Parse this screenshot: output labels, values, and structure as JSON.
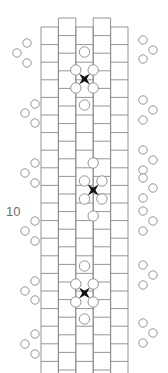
{
  "figure": {
    "type": "lattice-diagram",
    "width": 168,
    "height": 373,
    "background": "#ffffff",
    "axis_label": {
      "text": "10",
      "x": 6,
      "y": 216,
      "color": "#6e6e6e",
      "font_size": 13
    }
  },
  "style": {
    "grid_stroke": "#8a8a8a",
    "grid_stroke_width": 0.9,
    "cell_fill": "none",
    "circle_stroke": "#8a8a8a",
    "circle_stroke_width": 0.9,
    "circle_fill": "#ffffff",
    "marker_fill": "#111111",
    "cluster_circle_r": 4.2,
    "lattice_circle_r": 5.2,
    "marker_r": 5.4
  },
  "chart_data": {
    "type": "diagram",
    "title": "",
    "columns": [
      {
        "index": 0,
        "x": 41.0,
        "width": 17.4,
        "y_offset": 9.0
      },
      {
        "index": 1,
        "x": 58.4,
        "width": 17.4,
        "y_offset": 0.0
      },
      {
        "index": 2,
        "x": 75.8,
        "width": 17.4,
        "y_offset": 9.0
      },
      {
        "index": 3,
        "x": 93.2,
        "width": 17.4,
        "y_offset": 0.0
      },
      {
        "index": 4,
        "x": 110.6,
        "width": 17.4,
        "y_offset": 9.0
      }
    ],
    "row_height": 17.6,
    "grid_top": 18,
    "grid_bottom": 373,
    "markers": [
      {
        "name": "marker-1",
        "cx": 84.5,
        "cy": 79.0
      },
      {
        "name": "marker-2",
        "cx": 93.2,
        "cy": 190.0
      },
      {
        "name": "marker-3",
        "cx": 84.5,
        "cy": 293.0
      }
    ],
    "lattice_circles": [
      {
        "cx": 84.5,
        "cy": 52.0
      },
      {
        "cx": 93.2,
        "cy": 70.0
      },
      {
        "cx": 75.8,
        "cy": 70.0
      },
      {
        "cx": 93.2,
        "cy": 88.0
      },
      {
        "cx": 75.8,
        "cy": 88.0
      },
      {
        "cx": 84.5,
        "cy": 105.0
      },
      {
        "cx": 93.2,
        "cy": 163.0
      },
      {
        "cx": 101.9,
        "cy": 181.0
      },
      {
        "cx": 84.5,
        "cy": 181.0
      },
      {
        "cx": 101.9,
        "cy": 199.0
      },
      {
        "cx": 84.5,
        "cy": 199.0
      },
      {
        "cx": 93.2,
        "cy": 216.0
      },
      {
        "cx": 84.5,
        "cy": 266.0
      },
      {
        "cx": 93.2,
        "cy": 284.0
      },
      {
        "cx": 75.8,
        "cy": 284.0
      },
      {
        "cx": 93.2,
        "cy": 302.0
      },
      {
        "cx": 75.8,
        "cy": 302.0
      },
      {
        "cx": 84.5,
        "cy": 319.0
      }
    ],
    "side_clusters": [
      {
        "side": "left",
        "circles": [
          {
            "cx": 27,
            "cy": 43
          },
          {
            "cx": 17,
            "cy": 53
          },
          {
            "cx": 27,
            "cy": 63
          }
        ]
      },
      {
        "side": "left",
        "circles": [
          {
            "cx": 35,
            "cy": 104
          },
          {
            "cx": 25,
            "cy": 113
          },
          {
            "cx": 35,
            "cy": 123
          }
        ]
      },
      {
        "side": "left",
        "circles": [
          {
            "cx": 35,
            "cy": 163
          },
          {
            "cx": 25,
            "cy": 173
          },
          {
            "cx": 35,
            "cy": 183
          }
        ]
      },
      {
        "side": "left",
        "circles": [
          {
            "cx": 35,
            "cy": 221
          },
          {
            "cx": 25,
            "cy": 231
          },
          {
            "cx": 35,
            "cy": 241
          }
        ]
      },
      {
        "side": "left",
        "circles": [
          {
            "cx": 35,
            "cy": 281
          },
          {
            "cx": 25,
            "cy": 291
          },
          {
            "cx": 35,
            "cy": 300
          }
        ]
      },
      {
        "side": "left",
        "circles": [
          {
            "cx": 35,
            "cy": 334
          },
          {
            "cx": 25,
            "cy": 344
          },
          {
            "cx": 35,
            "cy": 354
          }
        ]
      },
      {
        "side": "right",
        "circles": [
          {
            "cx": 143,
            "cy": 40
          },
          {
            "cx": 153,
            "cy": 50
          },
          {
            "cx": 143,
            "cy": 59
          }
        ]
      },
      {
        "side": "right",
        "circles": [
          {
            "cx": 143,
            "cy": 100
          },
          {
            "cx": 153,
            "cy": 110
          },
          {
            "cx": 143,
            "cy": 120
          }
        ]
      },
      {
        "side": "right",
        "circles": [
          {
            "cx": 143,
            "cy": 150
          },
          {
            "cx": 153,
            "cy": 160
          },
          {
            "cx": 143,
            "cy": 170
          }
        ]
      },
      {
        "side": "right",
        "circles": [
          {
            "cx": 143,
            "cy": 178
          },
          {
            "cx": 153,
            "cy": 188
          },
          {
            "cx": 143,
            "cy": 198
          }
        ]
      },
      {
        "side": "right",
        "circles": [
          {
            "cx": 143,
            "cy": 211
          },
          {
            "cx": 153,
            "cy": 221
          },
          {
            "cx": 143,
            "cy": 231
          }
        ]
      },
      {
        "side": "right",
        "circles": [
          {
            "cx": 143,
            "cy": 265
          },
          {
            "cx": 153,
            "cy": 275
          },
          {
            "cx": 143,
            "cy": 285
          }
        ]
      },
      {
        "side": "right",
        "circles": [
          {
            "cx": 143,
            "cy": 323
          },
          {
            "cx": 153,
            "cy": 333
          },
          {
            "cx": 143,
            "cy": 343
          }
        ]
      }
    ]
  }
}
